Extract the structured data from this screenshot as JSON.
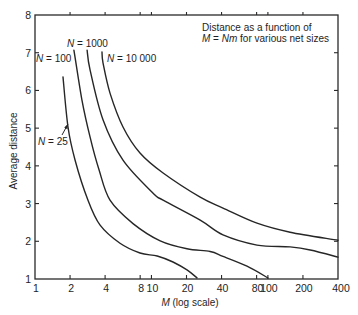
{
  "chart_data": {
    "type": "line",
    "title": "",
    "annotation": {
      "line1": "Distance as a function of",
      "line2": [
        {
          "text": "M",
          "italic": true
        },
        {
          "text": " = ",
          "italic": false
        },
        {
          "text": "Nm",
          "italic": true
        },
        {
          "text": " for various net sizes",
          "italic": false
        }
      ]
    },
    "xlabel": {
      "var": "M",
      "rest": " (log scale)"
    },
    "ylabel": "Average distance",
    "xscale": "log",
    "xlim": [
      1,
      400
    ],
    "ylim": [
      1,
      8
    ],
    "x_ticks": [
      1,
      2,
      4,
      8,
      10,
      20,
      40,
      80,
      100,
      200,
      400
    ],
    "x_tick_labels": [
      "1",
      "2",
      "4",
      "8",
      "10",
      "20",
      "40",
      "80",
      "100",
      "200",
      "400"
    ],
    "y_ticks": [
      1,
      2,
      3,
      4,
      5,
      6,
      7,
      8
    ],
    "y_tick_labels": [
      "1",
      "2",
      "3",
      "4",
      "5",
      "6",
      "7",
      "8"
    ],
    "grid": false,
    "legend": "inline labels near curve tops",
    "series": [
      {
        "name": "N = 25",
        "label": {
          "var": "N",
          "rest": " = 25"
        },
        "points": [
          [
            1.74,
            6.36
          ],
          [
            1.92,
            5.03
          ],
          [
            2.21,
            4.15
          ],
          [
            2.85,
            3.09
          ],
          [
            3.62,
            2.43
          ],
          [
            5.37,
            1.95
          ],
          [
            7.98,
            1.69
          ],
          [
            11.2,
            1.61
          ],
          [
            15.3,
            1.45
          ],
          [
            20.2,
            1.24
          ],
          [
            24.6,
            1.03
          ]
        ]
      },
      {
        "name": "N = 100",
        "label": {
          "var": "N",
          "rest": " = 100"
        },
        "points": [
          [
            2.16,
            7.07
          ],
          [
            2.53,
            5.75
          ],
          [
            2.97,
            4.76
          ],
          [
            3.55,
            3.89
          ],
          [
            4.41,
            3.09
          ],
          [
            6.95,
            2.47
          ],
          [
            11.9,
            2.01
          ],
          [
            20.2,
            1.8
          ],
          [
            31.9,
            1.73
          ],
          [
            41.2,
            1.6
          ],
          [
            66.2,
            1.34
          ],
          [
            100,
            1.03
          ]
        ]
      },
      {
        "name": "N = 1000",
        "label": {
          "var": "N",
          "rest": " = 1000"
        },
        "points": [
          [
            2.8,
            7.07
          ],
          [
            2.97,
            6.54
          ],
          [
            3.84,
            5.22
          ],
          [
            5.7,
            4.15
          ],
          [
            10.3,
            3.28
          ],
          [
            12.6,
            3.09
          ],
          [
            26.2,
            2.56
          ],
          [
            41.2,
            2.17
          ],
          [
            80.7,
            1.9
          ],
          [
            155,
            1.85
          ],
          [
            231,
            1.77
          ],
          [
            400,
            1.58
          ]
        ]
      },
      {
        "name": "N = 10 000",
        "label": {
          "var": "N",
          "rest": " = 10 000"
        },
        "points": [
          [
            3.76,
            7.02
          ],
          [
            3.84,
            6.73
          ],
          [
            4.41,
            5.93
          ],
          [
            5.7,
            5.03
          ],
          [
            7.98,
            4.34
          ],
          [
            12.6,
            3.81
          ],
          [
            26.2,
            3.17
          ],
          [
            41.2,
            2.88
          ],
          [
            80.7,
            2.48
          ],
          [
            155,
            2.24
          ],
          [
            400,
            2.03
          ]
        ]
      }
    ]
  },
  "colors": {
    "background": "#ffffff",
    "ink": "#262626"
  }
}
